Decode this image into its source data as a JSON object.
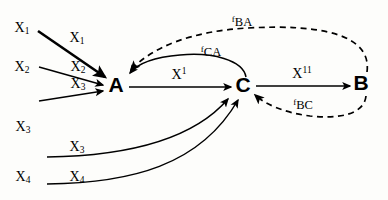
{
  "diagram": {
    "type": "signal-flow-graph",
    "title": "",
    "background_color": "#fdfdfb",
    "stroke_color": "#000000",
    "nodes": [
      {
        "id": "A",
        "label": "A",
        "x": 116,
        "y": 86
      },
      {
        "id": "C",
        "label": "C",
        "x": 243,
        "y": 86
      },
      {
        "id": "B",
        "label": "B",
        "x": 361,
        "y": 84
      }
    ],
    "source_labels": [
      {
        "name": "source-x1",
        "base": "X",
        "sub": "1",
        "x": 22,
        "y": 29
      },
      {
        "name": "source-x2",
        "base": "X",
        "sub": "2",
        "x": 22,
        "y": 68
      },
      {
        "name": "source-x3",
        "base": "X",
        "sub": "3",
        "x": 23,
        "y": 128
      },
      {
        "name": "source-x4",
        "base": "X",
        "sub": "4",
        "x": 23,
        "y": 178
      }
    ],
    "edge_labels": [
      {
        "name": "edge-label-x1",
        "base": "X",
        "sub": "1",
        "sup": "",
        "x": 77,
        "y": 39
      },
      {
        "name": "edge-label-x2",
        "base": "X",
        "sub": "2",
        "sup": "",
        "x": 78,
        "y": 68
      },
      {
        "name": "edge-label-x3-to-a",
        "base": "X",
        "sub": "3",
        "sup": "",
        "x": 78,
        "y": 85
      },
      {
        "name": "edge-label-x1-superscript",
        "base": "X",
        "sub": "",
        "sup": "1",
        "x": 179,
        "y": 76
      },
      {
        "name": "edge-label-x11-superscript",
        "base": "X",
        "sub": "",
        "sup": "11",
        "x": 302,
        "y": 75
      },
      {
        "name": "edge-label-x3-to-c",
        "base": "X",
        "sub": "3",
        "sup": "",
        "x": 77,
        "y": 148
      },
      {
        "name": "edge-label-x4-to-c",
        "base": "X",
        "sub": "4",
        "sup": "",
        "x": 77,
        "y": 178
      }
    ],
    "function_labels": [
      {
        "name": "feedback-label-f-ba",
        "base": "f",
        "sub": "BA",
        "x": 242,
        "y": 20
      },
      {
        "name": "feedback-label-f-ca",
        "base": "f",
        "sub": "CA",
        "x": 211,
        "y": 50
      },
      {
        "name": "feedback-label-f-bc",
        "base": "f",
        "sub": "BC",
        "x": 303,
        "y": 103
      }
    ],
    "edges": [
      {
        "name": "edge-x1-to-a",
        "from": "X1",
        "to": "A",
        "style": "solid-thick",
        "arrow": true
      },
      {
        "name": "edge-x2-to-a",
        "from": "X2",
        "to": "A",
        "style": "solid",
        "arrow": true
      },
      {
        "name": "edge-x3-to-a",
        "from": "X3",
        "to": "A",
        "style": "solid",
        "arrow": true
      },
      {
        "name": "edge-a-to-c",
        "from": "A",
        "to": "C",
        "style": "solid",
        "arrow": true,
        "label": "X^1"
      },
      {
        "name": "edge-c-to-b",
        "from": "C",
        "to": "B",
        "style": "solid",
        "arrow": true,
        "label": "X^11"
      },
      {
        "name": "edge-f-ba-b-to-a",
        "from": "B",
        "to": "A",
        "style": "dashed",
        "arrow": true,
        "label": "f_BA"
      },
      {
        "name": "edge-f-ca-c-to-a",
        "from": "C",
        "to": "A",
        "style": "solid",
        "arrow": true,
        "label": "f_CA"
      },
      {
        "name": "edge-f-bc-b-to-c",
        "from": "B",
        "to": "C",
        "style": "dashed",
        "arrow": true,
        "label": "f_BC"
      },
      {
        "name": "edge-x3-to-c",
        "from": "X3",
        "to": "C",
        "style": "solid",
        "arrow": true,
        "label": "X_3"
      },
      {
        "name": "edge-x4-to-c",
        "from": "X4",
        "to": "C",
        "style": "solid",
        "arrow": true,
        "label": "X_4"
      }
    ]
  }
}
